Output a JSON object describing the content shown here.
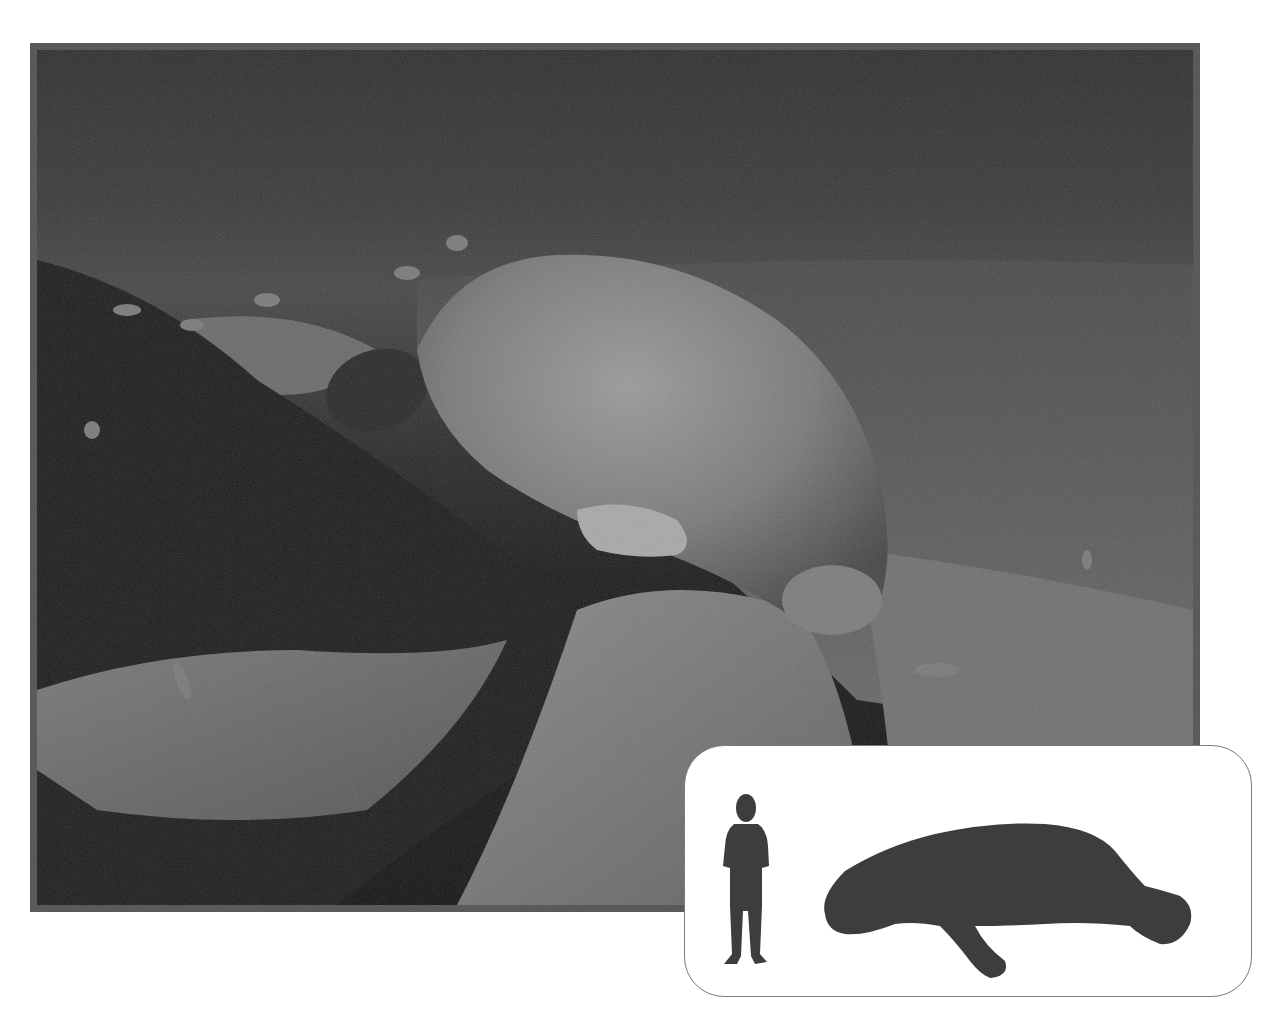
{
  "image": {
    "description": "Grayscale underwater photograph of a manatee grazing on a rocky, weedy riverbed with small fish swimming nearby",
    "subject": "manatee",
    "style": "black-and-white photograph with dark gray border"
  },
  "inset": {
    "description": "Size comparison silhouettes",
    "silhouettes": [
      {
        "name": "human child",
        "icon": "human-silhouette-icon"
      },
      {
        "name": "manatee",
        "icon": "manatee-silhouette-icon"
      }
    ]
  },
  "colors": {
    "frame_border": "#5a5a5a",
    "silhouette_fill": "#3d3d3d",
    "inset_background": "#ffffff",
    "inset_border": "#7a7a7a",
    "page_background": "#ffffff"
  }
}
